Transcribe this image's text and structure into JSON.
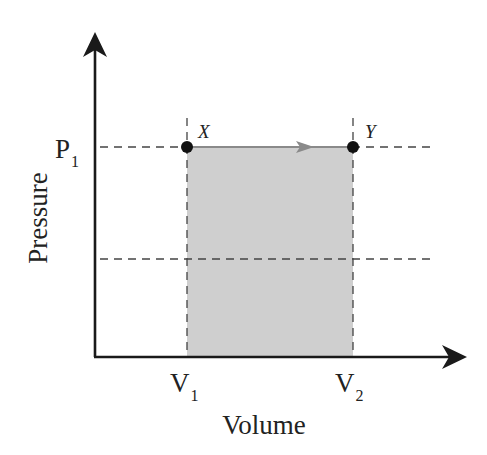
{
  "diagram": {
    "type": "pv-diagram",
    "process": "isobaric expansion",
    "axes": {
      "x_label": "Volume",
      "y_label": "Pressure"
    },
    "ticks": {
      "p1": {
        "main": "P",
        "sub": "1"
      },
      "v1": {
        "main": "V",
        "sub": "1"
      },
      "v2": {
        "main": "V",
        "sub": "2"
      }
    },
    "points": [
      {
        "id": "X",
        "label": "X",
        "volume": "V1",
        "pressure": "P1"
      },
      {
        "id": "Y",
        "label": "Y",
        "volume": "V2",
        "pressure": "P1"
      }
    ],
    "path": {
      "from": "X",
      "to": "Y",
      "direction": "right"
    },
    "shaded_region": {
      "meaning": "work done (area under path)",
      "from": "V1",
      "to": "V2"
    },
    "colors": {
      "axis": "#1a1a1a",
      "dashed": "#444444",
      "fill": "#cfcfcf",
      "path": "#8a8a8a",
      "point": "#111111"
    }
  }
}
